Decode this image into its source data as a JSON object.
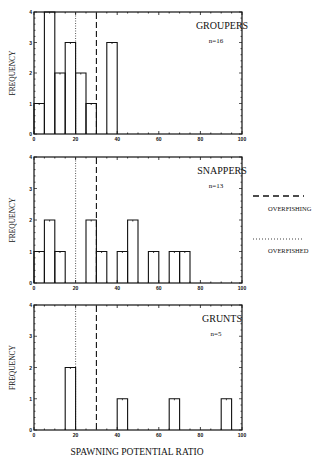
{
  "chart_data": [
    {
      "type": "bar",
      "title": "GROUPERS",
      "annotation": "n=16",
      "xlabel": "",
      "ylabel": "FREQUENCY",
      "xlim": [
        0,
        100
      ],
      "ylim": [
        0,
        4
      ],
      "xticks": [
        "0",
        "20",
        "40",
        "60",
        "80",
        "100"
      ],
      "yticks": [
        "0",
        "1",
        "2",
        "3",
        "4"
      ],
      "bin_width": 5,
      "bins": [
        {
          "x0": 0,
          "x1": 5,
          "count": 1
        },
        {
          "x0": 5,
          "x1": 10,
          "count": 4
        },
        {
          "x0": 10,
          "x1": 15,
          "count": 2
        },
        {
          "x0": 15,
          "x1": 20,
          "count": 3
        },
        {
          "x0": 20,
          "x1": 25,
          "count": 2
        },
        {
          "x0": 25,
          "x1": 30,
          "count": 1
        },
        {
          "x0": 35,
          "x1": 40,
          "count": 3
        }
      ],
      "reference_lines": [
        {
          "name": "OVERFISHED",
          "x": 20,
          "style": "dotted"
        },
        {
          "name": "OVERFISHING",
          "x": 30,
          "style": "dashed"
        }
      ]
    },
    {
      "type": "bar",
      "title": "SNAPPERS",
      "annotation": "n=13",
      "xlabel": "",
      "ylabel": "FREQUENCY",
      "xlim": [
        0,
        100
      ],
      "ylim": [
        0,
        4
      ],
      "xticks": [
        "0",
        "20",
        "40",
        "60",
        "80",
        "100"
      ],
      "yticks": [
        "0",
        "1",
        "2",
        "3",
        "4"
      ],
      "bin_width": 5,
      "bins": [
        {
          "x0": 0,
          "x1": 5,
          "count": 1
        },
        {
          "x0": 5,
          "x1": 10,
          "count": 2
        },
        {
          "x0": 10,
          "x1": 15,
          "count": 1
        },
        {
          "x0": 25,
          "x1": 30,
          "count": 2
        },
        {
          "x0": 30,
          "x1": 35,
          "count": 1
        },
        {
          "x0": 40,
          "x1": 45,
          "count": 1
        },
        {
          "x0": 45,
          "x1": 50,
          "count": 2
        },
        {
          "x0": 55,
          "x1": 60,
          "count": 1
        },
        {
          "x0": 65,
          "x1": 70,
          "count": 1
        },
        {
          "x0": 70,
          "x1": 75,
          "count": 1
        }
      ],
      "reference_lines": [
        {
          "name": "OVERFISHED",
          "x": 20,
          "style": "dotted"
        },
        {
          "name": "OVERFISHING",
          "x": 30,
          "style": "dashed"
        }
      ]
    },
    {
      "type": "bar",
      "title": "GRUNTS",
      "annotation": "n=5",
      "xlabel": "SPAWNING POTENTIAL RATIO",
      "ylabel": "FREQUENCY",
      "xlim": [
        0,
        100
      ],
      "ylim": [
        0,
        4
      ],
      "xticks": [
        "0",
        "20",
        "40",
        "60",
        "80",
        "100"
      ],
      "yticks": [
        "0",
        "1",
        "2",
        "3",
        "4"
      ],
      "bin_width": 5,
      "bins": [
        {
          "x0": 15,
          "x1": 20,
          "count": 2
        },
        {
          "x0": 40,
          "x1": 45,
          "count": 1
        },
        {
          "x0": 65,
          "x1": 70,
          "count": 1
        },
        {
          "x0": 90,
          "x1": 95,
          "count": 1
        }
      ],
      "reference_lines": [
        {
          "name": "OVERFISHED",
          "x": 20,
          "style": "dotted"
        },
        {
          "name": "OVERFISHING",
          "x": 30,
          "style": "dashed"
        }
      ]
    }
  ],
  "legend": {
    "items": [
      {
        "label": "OVERFISHING",
        "style": "dashed"
      },
      {
        "label": "OVERFISHED",
        "style": "dotted"
      }
    ]
  },
  "xlabel": "SPAWNING POTENTIAL RATIO",
  "colors": {
    "ink": "#111111",
    "background": "#ffffff"
  }
}
